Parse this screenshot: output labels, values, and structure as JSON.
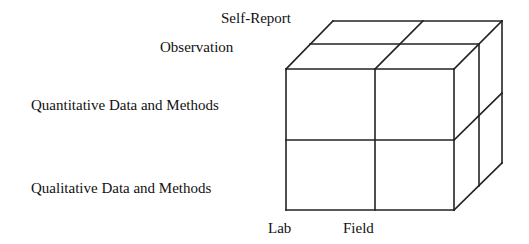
{
  "diagram": {
    "type": "3d-cube",
    "depth_labels": {
      "back": "Self-Report",
      "front": "Observation"
    },
    "row_labels": {
      "top": "Quantitative Data and Methods",
      "bottom": "Qualitative Data and Methods"
    },
    "column_labels": {
      "left": "Lab",
      "right": "Field"
    },
    "colors": {
      "line": "#222222",
      "background": "#ffffff"
    }
  }
}
